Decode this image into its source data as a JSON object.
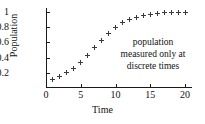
{
  "chart_data": {
    "type": "scatter",
    "title": "",
    "xlabel": "Time",
    "ylabel": "Population",
    "xlim": [
      0,
      21
    ],
    "ylim": [
      0,
      1.05
    ],
    "grid": false,
    "legend": null,
    "marker": "plus",
    "marker_color": "#3a3a3a",
    "xticks": [
      0,
      5,
      10,
      15,
      20
    ],
    "xticklabels": [
      "0",
      "5",
      "10",
      "15",
      "20"
    ],
    "yticks": [
      0.2,
      0.4,
      0.6,
      0.8,
      1
    ],
    "yticklabels": [
      "0.2",
      "0.4",
      "0.6",
      "0.8",
      "1"
    ],
    "x": [
      1,
      2,
      3,
      4,
      5,
      6,
      7,
      8,
      9,
      10,
      11,
      12,
      13,
      14,
      15,
      16,
      17,
      18,
      19,
      20
    ],
    "y": [
      0.11,
      0.15,
      0.2,
      0.26,
      0.34,
      0.43,
      0.53,
      0.63,
      0.72,
      0.8,
      0.86,
      0.9,
      0.93,
      0.95,
      0.97,
      0.98,
      0.985,
      0.99,
      0.993,
      0.995
    ],
    "annotations": [
      {
        "lines": [
          "population",
          "measured only at",
          "discrete times"
        ],
        "x": 12.5,
        "y": 0.6
      }
    ]
  },
  "axes": {
    "y_title": "Population",
    "x_title": "Time"
  }
}
